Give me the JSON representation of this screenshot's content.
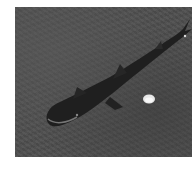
{
  "image": {
    "subject": "shark",
    "setting": "sandy seafloor",
    "objects": [
      "shark",
      "white shell"
    ],
    "colors": {
      "sand": "#4e4e4e",
      "shark_body": "#1e1e1e",
      "shell": "#e8e8e8",
      "background": "#ffffff"
    }
  }
}
